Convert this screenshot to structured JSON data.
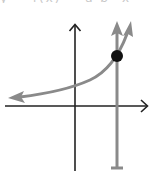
{
  "header": {
    "cropped_text": "y = f(x) = a·b^x"
  },
  "diagram": {
    "type": "exponential-graph",
    "colors": {
      "axis": "#222222",
      "curve": "#8a8a8a",
      "vertical_line": "#8a8a8a",
      "point": "#111111",
      "background": "#ffffff"
    },
    "axes": {
      "origin_px": [
        75,
        106
      ],
      "x_axis": {
        "from_px": [
          5,
          106
        ],
        "to_px": [
          148,
          106
        ],
        "arrow": "right"
      },
      "y_axis": {
        "from_px": [
          75,
          171
        ],
        "to_px": [
          75,
          24
        ],
        "arrow": "up"
      }
    },
    "curve": {
      "description": "increasing exponential curve, asymptotic toward x-axis on the left",
      "left_arrow_px": [
        10,
        98
      ],
      "y_intercept_px": [
        75,
        86
      ],
      "right_arrow_px": [
        131,
        22
      ]
    },
    "vertical_line": {
      "x_px": 117,
      "top_arrow_px": [
        117,
        22
      ],
      "bottom_cap_px": [
        117,
        168
      ]
    },
    "point": {
      "center_px": [
        117,
        56
      ],
      "radius": 6,
      "label": "intersection of curve and vertical line"
    }
  }
}
